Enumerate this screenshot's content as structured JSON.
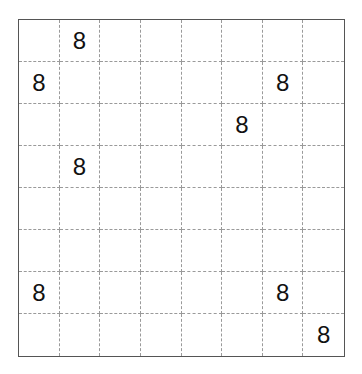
{
  "board": {
    "rows": 8,
    "cols": 8,
    "cells": [
      [
        "",
        "8",
        "",
        "",
        "",
        "",
        "",
        ""
      ],
      [
        "8",
        "",
        "",
        "",
        "",
        "",
        "8",
        ""
      ],
      [
        "",
        "",
        "",
        "",
        "",
        "8",
        "",
        ""
      ],
      [
        "",
        "8",
        "",
        "",
        "",
        "",
        "",
        ""
      ],
      [
        "",
        "",
        "",
        "",
        "",
        "",
        "",
        ""
      ],
      [
        "",
        "",
        "",
        "",
        "",
        "",
        "",
        ""
      ],
      [
        "8",
        "",
        "",
        "",
        "",
        "",
        "8",
        ""
      ],
      [
        "",
        "",
        "",
        "",
        "",
        "",
        "",
        "8"
      ]
    ]
  }
}
